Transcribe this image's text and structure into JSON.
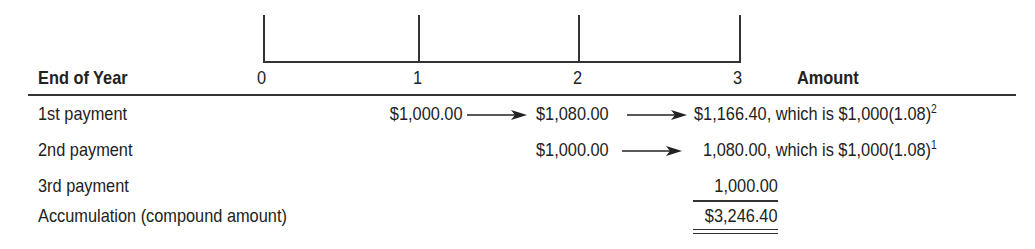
{
  "timeline": {
    "ticks": [
      "0",
      "1",
      "2",
      "3"
    ]
  },
  "header": {
    "row_label": "End of Year",
    "amount_label": "Amount"
  },
  "rows": [
    {
      "label": "1st payment",
      "values": [
        "$1,000.00",
        "$1,080.00",
        "$1,166.40"
      ],
      "note_prefix": ", which is $1,000(1.08)",
      "exponent": "2"
    },
    {
      "label": "2nd payment",
      "values": [
        "$1,000.00",
        "1,080.00"
      ],
      "note_prefix": ", which is $1,000(1.08)",
      "exponent": "1"
    },
    {
      "label": "3rd payment",
      "values": [
        "1,000.00"
      ]
    },
    {
      "label": "Accumulation (compound amount)",
      "total": "$3,246.40"
    }
  ],
  "colors": {
    "ink": "#222222",
    "background": "#ffffff"
  }
}
